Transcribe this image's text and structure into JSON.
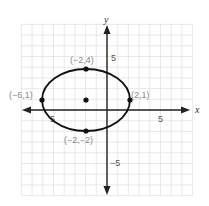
{
  "chart_data": {
    "type": "scatter",
    "title": "",
    "xlabel": "x",
    "ylabel": "y",
    "xlim": [
      -8,
      8
    ],
    "ylim": [
      -8,
      8
    ],
    "grid": true,
    "tick_labels": {
      "x": [
        {
          "value": -5,
          "label": "-5"
        },
        {
          "value": 5,
          "label": "5"
        }
      ],
      "y": [
        {
          "value": 5,
          "label": "5"
        },
        {
          "value": -5,
          "label": "-5"
        }
      ]
    },
    "curve": {
      "kind": "ellipse",
      "center": [
        -2,
        1
      ],
      "semi_axis_x": 4,
      "semi_axis_y": 3
    },
    "points": [
      {
        "x": -2,
        "y": 4,
        "label": "(−2,4)"
      },
      {
        "x": -6,
        "y": 1,
        "label": "(−6,1)"
      },
      {
        "x": 2,
        "y": 1,
        "label": "(2,1)"
      },
      {
        "x": -2,
        "y": -2,
        "label": "(−2,−2)"
      },
      {
        "x": -2,
        "y": 1,
        "label": ""
      }
    ]
  },
  "axes": {
    "x_name": "x",
    "y_name": "y",
    "x_tick_neg": "5",
    "x_tick_pos": "5",
    "y_tick_pos": "5",
    "y_tick_neg": "−5"
  },
  "labels": {
    "top": "(−2,4)",
    "left": "(−6,1)",
    "right": "(2,1)",
    "bottom": "(−2,−2)"
  },
  "colors": {
    "grid": "#e2e2e2",
    "axis": "#222222",
    "curve": "#111111",
    "label": "#8a8a8a"
  }
}
